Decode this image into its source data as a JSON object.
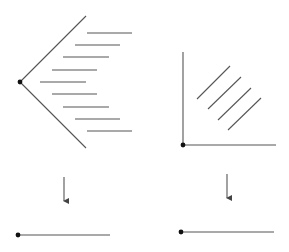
{
  "diagram": {
    "colors": {
      "stroke": "#555555",
      "dot": "#111111",
      "background": "#ffffff"
    },
    "left_panel": {
      "apex": {
        "x": 20,
        "y": 82
      },
      "upper_ray": {
        "x1": 20,
        "y1": 82,
        "x2": 86,
        "y2": 16
      },
      "lower_ray": {
        "x1": 20,
        "y1": 82,
        "x2": 86,
        "y2": 148
      },
      "hatch_lines": [
        {
          "x1": 87,
          "x2": 132,
          "y": 33
        },
        {
          "x1": 75,
          "x2": 120,
          "y": 45
        },
        {
          "x1": 63,
          "x2": 109,
          "y": 57
        },
        {
          "x1": 52,
          "x2": 97,
          "y": 70
        },
        {
          "x1": 40,
          "x2": 86,
          "y": 82
        },
        {
          "x1": 52,
          "x2": 97,
          "y": 94
        },
        {
          "x1": 63,
          "x2": 109,
          "y": 107
        },
        {
          "x1": 75,
          "x2": 120,
          "y": 119
        },
        {
          "x1": 87,
          "x2": 132,
          "y": 131
        }
      ],
      "arrow": {
        "x": 64,
        "y1": 177,
        "y2": 206
      },
      "result_segment": {
        "x1": 18,
        "x2": 110,
        "y": 235
      }
    },
    "right_panel": {
      "origin": {
        "x": 183,
        "y": 145
      },
      "y_axis": {
        "x": 183,
        "y1": 52,
        "y2": 145
      },
      "x_axis": {
        "y": 145,
        "x1": 183,
        "x2": 276
      },
      "diagonal_lines": [
        {
          "x1": 197,
          "y1": 99,
          "x2": 230,
          "y2": 66
        },
        {
          "x1": 208,
          "y1": 109,
          "x2": 241,
          "y2": 77
        },
        {
          "x1": 218,
          "y1": 120,
          "x2": 251,
          "y2": 88
        },
        {
          "x1": 228,
          "y1": 130,
          "x2": 261,
          "y2": 98
        }
      ],
      "arrow": {
        "x": 227,
        "y1": 174,
        "y2": 203
      },
      "result_segment": {
        "x1": 181,
        "x2": 274,
        "y": 232
      }
    }
  }
}
